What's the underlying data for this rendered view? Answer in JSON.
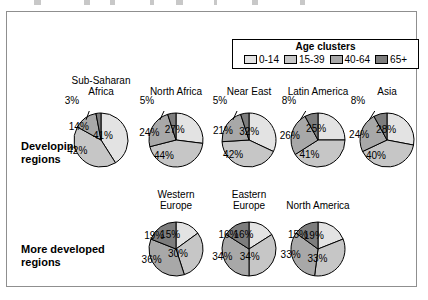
{
  "legend": {
    "title": "Age clusters",
    "items": [
      {
        "label": "0-14",
        "color": "#e3e3e3"
      },
      {
        "label": "15-39",
        "color": "#c6c6c6"
      },
      {
        "label": "40-64",
        "color": "#a8a8a8"
      },
      {
        "label": "65+",
        "color": "#7d7d7d"
      }
    ]
  },
  "rows": [
    {
      "id": "developing",
      "label": "Developing regions"
    },
    {
      "id": "developed",
      "label": "More developed regions"
    }
  ],
  "chart_data": {
    "type": "pie",
    "title": "Age clusters",
    "categories": [
      "0-14",
      "15-39",
      "40-64",
      "65+"
    ],
    "colors": [
      "#e3e3e3",
      "#c6c6c6",
      "#a8a8a8",
      "#7d7d7d"
    ],
    "unit": "%",
    "legend_position": "top-right",
    "groups": [
      {
        "name": "Developing regions",
        "charts": [
          {
            "title": "Sub-Saharan Africa",
            "values": [
              41,
              42,
              14,
              3
            ],
            "labels": [
              "41%",
              "42%",
              "14%",
              "3%"
            ],
            "callout_index": 3
          },
          {
            "title": "North Africa",
            "values": [
              27,
              44,
              24,
              5
            ],
            "labels": [
              "27%",
              "44%",
              "24%",
              "5%"
            ],
            "callout_index": 3
          },
          {
            "title": "Near East",
            "values": [
              32,
              42,
              21,
              5
            ],
            "labels": [
              "32%",
              "42%",
              "21%",
              "5%"
            ],
            "callout_index": 3
          },
          {
            "title": "Latin America",
            "values": [
              25,
              41,
              26,
              8
            ],
            "labels": [
              "25%",
              "41%",
              "26%",
              "8%"
            ],
            "callout_index": 3
          },
          {
            "title": "Asia",
            "values": [
              28,
              40,
              24,
              8
            ],
            "labels": [
              "28%",
              "40%",
              "24%",
              "8%"
            ],
            "callout_index": 3
          }
        ]
      },
      {
        "name": "More developed regions",
        "charts": [
          {
            "title": "Western Europe",
            "values": [
              15,
              30,
              36,
              19
            ],
            "labels": [
              "15%",
              "30%",
              "36%",
              "19%"
            ],
            "callout_index": -1
          },
          {
            "title": "Eastern Europe",
            "values": [
              16,
              34,
              34,
              16
            ],
            "labels": [
              "16%",
              "34%",
              "34%",
              "16%"
            ],
            "callout_index": -1
          },
          {
            "title": "North America",
            "values": [
              19,
              33,
              33,
              15
            ],
            "labels": [
              "19%",
              "33%",
              "33%",
              "15%"
            ],
            "callout_index": -1
          }
        ]
      }
    ]
  },
  "layout": {
    "pies": [
      {
        "key": "sub-saharan-africa",
        "group": 0,
        "index": 0,
        "left": 58,
        "title_top": 74,
        "title": "Sub-Saharan\nAfrica",
        "pie_top": 110,
        "radius": 27
      },
      {
        "key": "north-africa",
        "group": 0,
        "index": 1,
        "left": 133,
        "title_top": 85,
        "title": "North Africa",
        "pie_top": 110,
        "radius": 27
      },
      {
        "key": "near-east",
        "group": 0,
        "index": 2,
        "left": 206,
        "title_top": 85,
        "title": "Near East",
        "pie_top": 110,
        "radius": 27
      },
      {
        "key": "latin-america",
        "group": 0,
        "index": 3,
        "left": 275,
        "title_top": 85,
        "title": "Latin America",
        "pie_top": 110,
        "radius": 27
      },
      {
        "key": "asia",
        "group": 0,
        "index": 4,
        "left": 344,
        "title_top": 85,
        "title": "Asia",
        "pie_top": 110,
        "radius": 27
      },
      {
        "key": "western-europe",
        "group": 1,
        "index": 0,
        "left": 133,
        "title_top": 188,
        "title": "Western\nEurope",
        "pie_top": 219,
        "radius": 27
      },
      {
        "key": "eastern-europe",
        "group": 1,
        "index": 1,
        "left": 206,
        "title_top": 188,
        "title": "Eastern\nEurope",
        "pie_top": 219,
        "radius": 27
      },
      {
        "key": "north-america",
        "group": 1,
        "index": 2,
        "left": 275,
        "title_top": 199,
        "title": "North America",
        "pie_top": 219,
        "radius": 27
      }
    ]
  }
}
